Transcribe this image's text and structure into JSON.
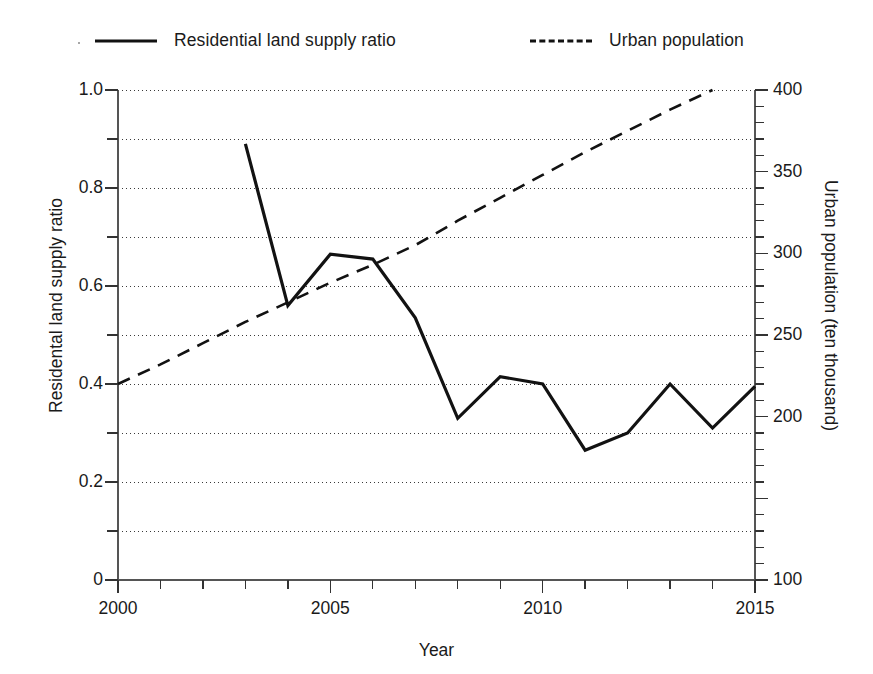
{
  "legend": {
    "items": [
      {
        "label": "Residential land supply ratio",
        "style": "solid",
        "color": "#121212"
      },
      {
        "label": "Urban population",
        "style": "dashed",
        "color": "#121212"
      }
    ]
  },
  "axes": {
    "x": {
      "title": "Year",
      "min": 2000,
      "max": 2015,
      "labels": [
        "2000",
        "2005",
        "2010",
        "2015"
      ],
      "label_values": [
        2000,
        2005,
        2010,
        2015
      ],
      "tick_step": 1
    },
    "y_left": {
      "title": "Residental land supply ratio",
      "min": 0,
      "max": 1.0,
      "labels": [
        "0",
        "0.2",
        "0.4",
        "0.6",
        "0.8",
        "1.0"
      ],
      "label_values": [
        0,
        0.2,
        0.4,
        0.6,
        0.8,
        1.0
      ],
      "tick_step": 0.1
    },
    "y_right": {
      "title": "Urban population (ten thousand)",
      "min": 100,
      "max": 400,
      "labels": [
        "100",
        "200",
        "250",
        "300",
        "350",
        "400"
      ],
      "label_values": [
        100,
        200,
        250,
        300,
        350,
        400
      ],
      "tick_step": 10
    }
  },
  "chart_data": {
    "type": "line",
    "title": "",
    "xlabel": "Year",
    "ylabel": "Residental land supply ratio",
    "ylabel_right": "Urban population (ten thousand)",
    "xlim": [
      2000,
      2015
    ],
    "ylim": [
      0,
      1.0
    ],
    "ylim_right": [
      100,
      400
    ],
    "grid": true,
    "grid_axis": "y",
    "legend_position": "top",
    "x": [
      2000,
      2001,
      2002,
      2003,
      2004,
      2005,
      2006,
      2007,
      2008,
      2009,
      2010,
      2011,
      2012,
      2013,
      2014,
      2015
    ],
    "series": [
      {
        "name": "Residential land supply ratio",
        "axis": "left",
        "style": "solid",
        "color": "#121212",
        "x": [
          2003,
          2004,
          2005,
          2006,
          2007,
          2008,
          2009,
          2010,
          2011,
          2012,
          2013,
          2014,
          2015
        ],
        "values": [
          0.89,
          0.56,
          0.665,
          0.655,
          0.535,
          0.33,
          0.415,
          0.4,
          0.265,
          0.3,
          0.4,
          0.31,
          0.395
        ]
      },
      {
        "name": "Urban population",
        "axis": "right",
        "style": "dashed",
        "color": "#121212",
        "x": [
          2000,
          2001,
          2002,
          2003,
          2004,
          2005,
          2006,
          2007,
          2008,
          2009,
          2010,
          2011,
          2012,
          2013,
          2014
        ],
        "values": [
          220,
          232,
          245,
          258,
          270,
          282,
          293,
          305,
          320,
          334,
          348,
          362,
          375,
          388,
          400
        ]
      }
    ]
  }
}
